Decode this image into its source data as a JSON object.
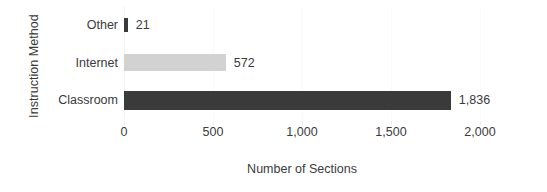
{
  "chart_data": {
    "type": "bar",
    "orientation": "horizontal",
    "title": "",
    "xlabel": "Number of Sections",
    "ylabel": "Instruction Method",
    "categories": [
      "Other",
      "Internet",
      "Classroom"
    ],
    "values": [
      21,
      572,
      1836
    ],
    "value_labels": [
      "21",
      "572",
      "1,836"
    ],
    "series": [
      {
        "name": "Number of Sections",
        "values": [
          21,
          572,
          1836
        ]
      }
    ],
    "xlim": [
      0,
      2000
    ],
    "xticks": [
      0,
      500,
      1000,
      1500,
      2000
    ],
    "xtick_labels": [
      "0",
      "500",
      "1,000",
      "1,500",
      "2,000"
    ],
    "grid": true,
    "legend": false,
    "bar_colors": [
      "#3a3a3a",
      "#d2d2d2",
      "#3a3a3a"
    ],
    "colors": {
      "background": "#ffffff",
      "text": "#3b3b3b",
      "dark_bar": "#3a3a3a",
      "light_bar": "#d2d2d2",
      "gridline": "#fafafa"
    }
  }
}
